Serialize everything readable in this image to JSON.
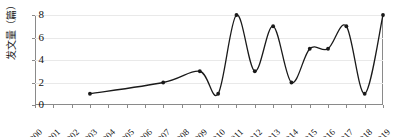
{
  "chart_data": {
    "type": "line",
    "title": "",
    "xlabel": "",
    "ylabel": "发文量（篇）",
    "categories": [
      "2000",
      "2001",
      "2002",
      "2003",
      "2004",
      "2005",
      "2006",
      "2007",
      "2008",
      "2009",
      "2010",
      "2011",
      "2012",
      "2013",
      "2014",
      "2015",
      "2016",
      "2017",
      "2018",
      "2019"
    ],
    "x": [
      2000,
      2001,
      2002,
      2003,
      2004,
      2005,
      2006,
      2007,
      2008,
      2009,
      2010,
      2011,
      2012,
      2013,
      2014,
      2015,
      2016,
      2017,
      2018,
      2019
    ],
    "values": [
      null,
      null,
      null,
      1,
      null,
      null,
      null,
      2,
      null,
      3,
      1,
      8,
      3,
      7,
      2,
      5,
      5,
      7,
      1,
      8
    ],
    "points": [
      {
        "x": "2003",
        "y": 1
      },
      {
        "x": "2007",
        "y": 2
      },
      {
        "x": "2009",
        "y": 3
      },
      {
        "x": "2010",
        "y": 1
      },
      {
        "x": "2011",
        "y": 8
      },
      {
        "x": "2012",
        "y": 3
      },
      {
        "x": "2013",
        "y": 7
      },
      {
        "x": "2014",
        "y": 2
      },
      {
        "x": "2015",
        "y": 5
      },
      {
        "x": "2016",
        "y": 5
      },
      {
        "x": "2017",
        "y": 7
      },
      {
        "x": "2018",
        "y": 1
      },
      {
        "x": "2019",
        "y": 8
      }
    ],
    "ylim": [
      0,
      8
    ],
    "yticks": [
      0,
      2,
      4,
      6,
      8
    ],
    "ytick_labels": [
      "0",
      "2",
      "4",
      "6",
      "8"
    ],
    "xlim": [
      "2000",
      "2019"
    ],
    "grid": "horizontal",
    "legend": "none",
    "interpolation": "spline",
    "line_color": "#1a1a1a",
    "marker_color": "#1a1a1a",
    "grid_color": "#e9e9e9",
    "axis_color": "#8a8a8a"
  }
}
